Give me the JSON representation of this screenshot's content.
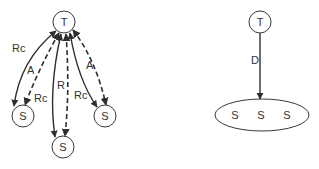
{
  "left_diagram": {
    "center_node": {
      "label": "T"
    },
    "leaf_nodes": [
      {
        "label": "S"
      },
      {
        "label": "S"
      },
      {
        "label": "S"
      }
    ],
    "edge_labels": {
      "left_solid": "Rc",
      "left_dashed": "A",
      "center_solid": "Rc",
      "center_dashed": "R",
      "right_solid": "Rc",
      "right_dashed": "A"
    }
  },
  "right_diagram": {
    "center_node": {
      "label": "T"
    },
    "edge_label": "D",
    "group_members": [
      {
        "label": "S"
      },
      {
        "label": "S"
      },
      {
        "label": "S"
      }
    ]
  },
  "colors": {
    "stroke": "#2e2e2e",
    "text": "#333333",
    "background": "#ffffff"
  }
}
